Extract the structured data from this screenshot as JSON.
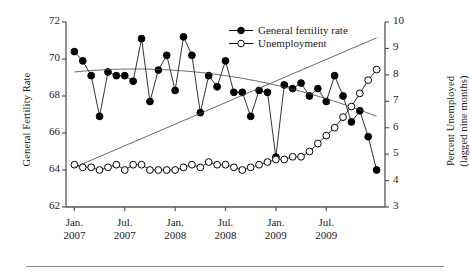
{
  "figure": {
    "left_axis_title": "General Fertility Rate",
    "right_axis_title_line1": "Percent Unemployed",
    "right_axis_title_line2": "(lagged nine months)"
  },
  "legend": {
    "position": "top-right",
    "entries": [
      {
        "label": "General fertility rate",
        "marker": "filled-circle-icon",
        "color": "#000000"
      },
      {
        "label": "Unemployment",
        "marker": "open-circle-icon",
        "color": "#000000"
      }
    ]
  },
  "chart_data": {
    "type": "line",
    "title": "",
    "xlabel": "",
    "grid": false,
    "legend_position": "top-right",
    "x_tick_labels": [
      {
        "month": "Jan.",
        "year": "2007"
      },
      {
        "month": "Jul.",
        "year": "2007"
      },
      {
        "month": "Jan.",
        "year": "2008"
      },
      {
        "month": "Jul.",
        "year": "2008"
      },
      {
        "month": "Jan.",
        "year": "2009"
      },
      {
        "month": "Jul.",
        "year": "2009"
      }
    ],
    "x_tick_index": [
      0,
      6,
      12,
      18,
      24,
      30
    ],
    "x_range_index": [
      -1,
      37
    ],
    "left_axis": {
      "label": "General Fertility Rate",
      "ylim": [
        62,
        72
      ],
      "ticks": [
        62,
        64,
        66,
        68,
        70,
        72
      ],
      "tick_labels": [
        "62",
        "64",
        "66",
        "68",
        "70",
        "72"
      ]
    },
    "right_axis": {
      "label": "Percent Unemployed (lagged nine months)",
      "ylim": [
        3,
        10
      ],
      "ticks": [
        3,
        4,
        5,
        6,
        7,
        8,
        9,
        10
      ],
      "tick_labels": [
        "3",
        "4",
        "5",
        "6",
        "7",
        "8",
        "9",
        "10"
      ]
    },
    "series": [
      {
        "name": "General fertility rate",
        "axis": "left",
        "marker": "filled-circle",
        "x_index": [
          0,
          1,
          2,
          3,
          4,
          5,
          6,
          7,
          8,
          9,
          10,
          11,
          12,
          13,
          14,
          15,
          16,
          17,
          18,
          19,
          20,
          21,
          22,
          23,
          24,
          25,
          26,
          27,
          28,
          29,
          30,
          31,
          32,
          33,
          34,
          35,
          36
        ],
        "values": [
          70.4,
          69.9,
          69.1,
          66.9,
          69.3,
          69.1,
          69.1,
          68.8,
          71.1,
          67.7,
          69.4,
          70.2,
          68.3,
          71.2,
          70.2,
          67.1,
          69.1,
          68.5,
          69.9,
          68.2,
          68.2,
          66.9,
          68.3,
          68.2,
          64.7,
          68.6,
          68.4,
          68.7,
          68.0,
          68.4,
          67.7,
          69.1,
          68.0,
          66.6,
          67.2,
          65.8,
          64.0,
          66.8
        ],
        "trend": {
          "type": "quadratic",
          "start_value": 69.3,
          "mid_value": 69.1,
          "end_value": 66.9
        }
      },
      {
        "name": "Unemployment",
        "axis": "right",
        "marker": "open-circle",
        "x_index": [
          0,
          1,
          2,
          3,
          4,
          5,
          6,
          7,
          8,
          9,
          10,
          11,
          12,
          13,
          14,
          15,
          16,
          17,
          18,
          19,
          20,
          21,
          22,
          23,
          24,
          25,
          26,
          27,
          28,
          29,
          30,
          31,
          32,
          33,
          34,
          35,
          36
        ],
        "values": [
          4.6,
          4.5,
          4.5,
          4.4,
          4.5,
          4.6,
          4.4,
          4.6,
          4.6,
          4.4,
          4.4,
          4.4,
          4.4,
          4.5,
          4.6,
          4.5,
          4.7,
          4.6,
          4.6,
          4.5,
          4.4,
          4.5,
          4.6,
          4.7,
          4.8,
          4.8,
          4.9,
          4.9,
          5.1,
          5.4,
          5.7,
          6.0,
          6.4,
          6.8,
          7.3,
          7.8,
          8.2,
          8.6,
          9.0,
          9.3,
          9.5
        ],
        "trend": {
          "type": "linear",
          "start_value": 4.5,
          "end_value": 9.4
        }
      }
    ]
  }
}
